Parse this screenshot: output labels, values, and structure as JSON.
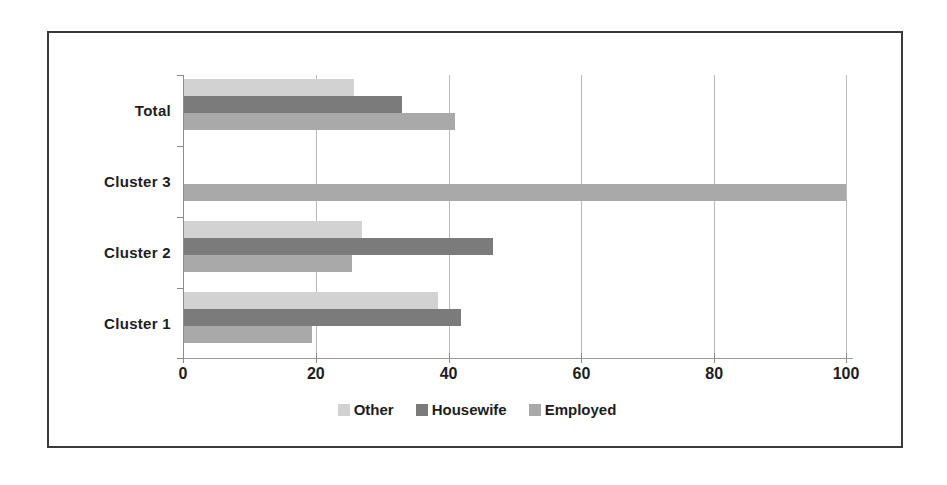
{
  "chart_data": {
    "type": "bar",
    "orientation": "horizontal",
    "title": "",
    "xlabel": "",
    "ylabel": "",
    "categories": [
      "Cluster 1",
      "Cluster 2",
      "Cluster 3",
      "Total"
    ],
    "category_order_top_to_bottom": [
      "Total",
      "Cluster 3",
      "Cluster 2",
      "Cluster 1"
    ],
    "series": [
      {
        "name": "Other",
        "color": "#d2d2d2",
        "values": [
          38.5,
          27.0,
          0,
          25.8
        ]
      },
      {
        "name": "Housewife",
        "color": "#7b7b7b",
        "values": [
          42.0,
          46.7,
          0,
          33.0
        ]
      },
      {
        "name": "Employed",
        "color": "#a9a9a9",
        "values": [
          19.5,
          25.5,
          100,
          41.0
        ]
      }
    ],
    "xlim": [
      0,
      100
    ],
    "xticks": [
      0,
      20,
      40,
      60,
      80,
      100
    ],
    "xtick_labels": [
      "0",
      "20",
      "40",
      "60",
      "80",
      "100"
    ],
    "grid": true,
    "gridlines_at": [
      20,
      40,
      60,
      80,
      100
    ],
    "legend_position": "bottom",
    "legend": [
      "Other",
      "Housewife",
      "Employed"
    ]
  },
  "axis": {
    "tick_0": "0",
    "tick_20": "20",
    "tick_40": "40",
    "tick_60": "60",
    "tick_80": "80",
    "tick_100": "100"
  },
  "labels": {
    "total": "Total",
    "cluster3": "Cluster 3",
    "cluster2": "Cluster 2",
    "cluster1": "Cluster 1"
  },
  "legend": {
    "other": "Other",
    "housewife": "Housewife",
    "employed": "Employed"
  },
  "colors": {
    "other": "#d2d2d2",
    "housewife": "#7b7b7b",
    "employed": "#a9a9a9",
    "frame": "#3a3a3a",
    "grid": "#b9b9b9",
    "text": "#1d1d1d"
  }
}
